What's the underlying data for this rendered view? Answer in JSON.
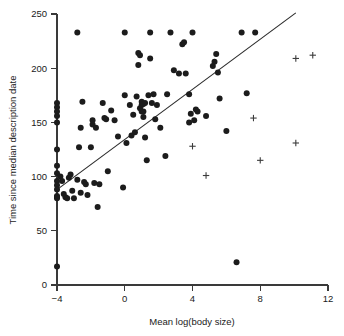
{
  "chart_data": {
    "type": "scatter",
    "title": "",
    "xlabel": "Mean log(body size)",
    "ylabel": "Time since median description date",
    "xlim": [
      -4,
      12
    ],
    "ylim": [
      0,
      250
    ],
    "xticks": [
      -4,
      0,
      4,
      8,
      12
    ],
    "xticklabels": [
      "−4",
      "0",
      "4",
      "8",
      "12"
    ],
    "yticks": [
      0,
      50,
      100,
      150,
      200,
      250
    ],
    "yticklabels": [
      "0",
      "50",
      "100",
      "150",
      "200",
      "250"
    ],
    "grid": false,
    "legend": null,
    "series": [
      {
        "name": "observations",
        "marker": "filled-circle",
        "color": "#1c1c1c",
        "points": [
          [
            -4.0,
            168
          ],
          [
            -4.0,
            164
          ],
          [
            -4.0,
            160
          ],
          [
            -4.0,
            156
          ],
          [
            -4.0,
            150
          ],
          [
            -4.0,
            125
          ],
          [
            -4.0,
            110
          ],
          [
            -4.0,
            103
          ],
          [
            -4.0,
            96
          ],
          [
            -4.0,
            92
          ],
          [
            -4.0,
            88
          ],
          [
            -4.0,
            82
          ],
          [
            -4.0,
            81
          ],
          [
            -4.0,
            80
          ],
          [
            -4.0,
            17
          ],
          [
            -3.8,
            100
          ],
          [
            -3.7,
            96
          ],
          [
            -3.6,
            84
          ],
          [
            -3.5,
            81
          ],
          [
            -3.4,
            80
          ],
          [
            -3.3,
            99
          ],
          [
            -3.2,
            102
          ],
          [
            -3.1,
            87
          ],
          [
            -3.0,
            80
          ],
          [
            -2.8,
            233
          ],
          [
            -2.8,
            97
          ],
          [
            -2.7,
            127
          ],
          [
            -2.6,
            145
          ],
          [
            -2.6,
            85
          ],
          [
            -2.5,
            169
          ],
          [
            -2.4,
            95
          ],
          [
            -2.3,
            93
          ],
          [
            -2.2,
            83
          ],
          [
            -2.0,
            127
          ],
          [
            -1.9,
            148
          ],
          [
            -1.9,
            152
          ],
          [
            -1.8,
            94
          ],
          [
            -1.7,
            145
          ],
          [
            -1.6,
            72
          ],
          [
            -1.5,
            93
          ],
          [
            -1.3,
            168
          ],
          [
            -1.2,
            154
          ],
          [
            -1.1,
            153
          ],
          [
            -1.0,
            105
          ],
          [
            -0.8,
            161
          ],
          [
            -0.6,
            152
          ],
          [
            -0.4,
            137
          ],
          [
            -0.1,
            90
          ],
          [
            0.0,
            175
          ],
          [
            0.0,
            233
          ],
          [
            0.1,
            131
          ],
          [
            0.3,
            166
          ],
          [
            0.4,
            138
          ],
          [
            0.5,
            157
          ],
          [
            0.6,
            141
          ],
          [
            0.7,
            174
          ],
          [
            0.8,
            203
          ],
          [
            0.8,
            214
          ],
          [
            0.9,
            212
          ],
          [
            0.9,
            163
          ],
          [
            1.0,
            160
          ],
          [
            1.0,
            166
          ],
          [
            1.0,
            169
          ],
          [
            1.1,
            167
          ],
          [
            1.1,
            160
          ],
          [
            1.1,
            155
          ],
          [
            1.2,
            168
          ],
          [
            1.2,
            136
          ],
          [
            1.3,
            115
          ],
          [
            1.4,
            175
          ],
          [
            1.5,
            233
          ],
          [
            1.5,
            209
          ],
          [
            1.6,
            168
          ],
          [
            1.7,
            176
          ],
          [
            1.8,
            153
          ],
          [
            1.9,
            166
          ],
          [
            2.1,
            145
          ],
          [
            2.4,
            119
          ],
          [
            2.5,
            176
          ],
          [
            2.7,
            233
          ],
          [
            2.9,
            198
          ],
          [
            3.2,
            195
          ],
          [
            3.4,
            222
          ],
          [
            3.5,
            224
          ],
          [
            3.6,
            195
          ],
          [
            3.8,
            176
          ],
          [
            3.8,
            150
          ],
          [
            3.9,
            158
          ],
          [
            4.0,
            233
          ],
          [
            4.1,
            152
          ],
          [
            4.2,
            162
          ],
          [
            4.3,
            160
          ],
          [
            4.8,
            156
          ],
          [
            5.2,
            202
          ],
          [
            5.3,
            206
          ],
          [
            5.4,
            213
          ],
          [
            5.5,
            196
          ],
          [
            5.6,
            172
          ],
          [
            6.0,
            142
          ],
          [
            6.6,
            21
          ],
          [
            6.9,
            233
          ],
          [
            7.2,
            177
          ],
          [
            7.7,
            233
          ]
        ]
      },
      {
        "name": "high-body-size-group",
        "marker": "plus",
        "color": "#3c3c3c",
        "points": [
          [
            4.0,
            128
          ],
          [
            4.8,
            101
          ],
          [
            7.6,
            154
          ],
          [
            8.0,
            115
          ],
          [
            10.1,
            131
          ],
          [
            10.1,
            209
          ],
          [
            11.1,
            212
          ]
        ]
      }
    ],
    "fit_line": {
      "name": "regression-line",
      "x_start": -4.0,
      "y_start": 88,
      "x_end": 10.1,
      "y_end": 251,
      "color": "#2b2b2b"
    }
  }
}
